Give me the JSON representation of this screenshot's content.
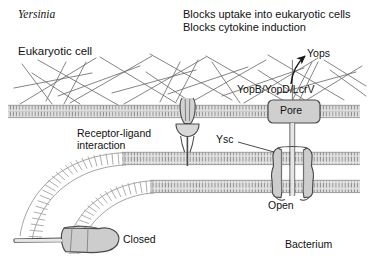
{
  "figure": {
    "title_organism": "Yersinia",
    "background_color": "#ffffff",
    "width": 368,
    "height": 268
  },
  "labels": {
    "organism": "Yersinia",
    "eukaryotic_cell": "Eukaryotic cell",
    "effects_line1": "Blocks uptake into eukaryotic cells",
    "effects_line2": "Blocks cytokine induction",
    "yops": "Yops",
    "translocators": "YopB/YopD/LcrV",
    "pore": "Pore",
    "receptor_ligand_line1": "Receptor-ligand",
    "receptor_ligand_line2": "interaction",
    "ysc": "Ysc",
    "open": "Open",
    "closed": "Closed",
    "bacterium": "Bacterium"
  },
  "colors": {
    "membrane_fill": "#d8d8d8",
    "membrane_stroke": "#9a9a9a",
    "protein_fill": "#c9c9c9",
    "protein_stroke": "#4a4a4a",
    "cytoskeleton": "#6e6e6e",
    "text": "#111111",
    "arrow": "#1a1a1a"
  },
  "structures": {
    "eukaryotic_membrane_y": 110,
    "bacterial_outer_membrane_y": 158,
    "bacterial_inner_membrane_y": 186,
    "pore_label_box": "Pore",
    "secretion_system_open": "Open",
    "secretion_system_closed": "Closed"
  }
}
